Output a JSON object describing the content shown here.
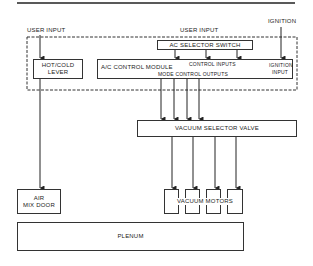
{
  "diagram": {
    "inputs": {
      "user_input_left": "USER INPUT",
      "user_input_center": "USER INPUT",
      "ignition": "IGNITION"
    },
    "components": {
      "ac_selector_switch": "AC SELECTOR SWITCH",
      "hot_cold_lever": [
        "HOT/COLD",
        "LEVER"
      ],
      "ac_control_module": "A/C CONTROL MODULE",
      "control_inputs": "CONTROL INPUTS",
      "ignition_input": [
        "IGNITION",
        "INPUT"
      ],
      "mode_control_outputs": "MODE CONTROL OUTPUTS",
      "vacuum_selector_valve": "VACUUM SELECTOR VALVE",
      "air_mix_door": [
        "AIR",
        "MIX DOOR"
      ],
      "vacuum_motors": "VACUUM MOTORS",
      "vacuum_motor_count": 4,
      "plenum": "PLENUM"
    },
    "colors": {
      "line": "#333333",
      "background": "#ffffff"
    }
  }
}
